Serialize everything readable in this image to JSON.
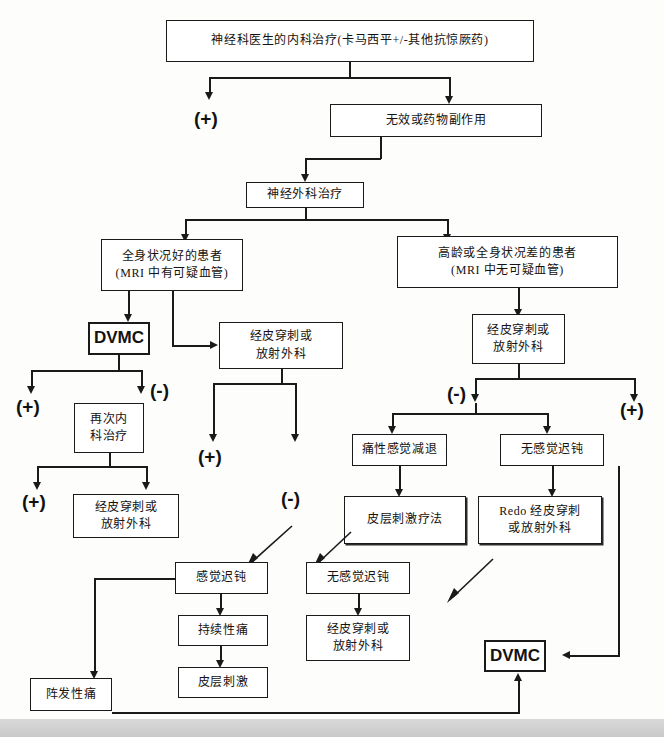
{
  "diagram": {
    "title_text": "神经科医生的内科治疗(卡马西平+/-其他抗惊厥药)",
    "nodes": {
      "medical_treatment": "神经科医生的内科治疗(卡马西平+/-其他抗惊厥药)",
      "ineffective_side_effects": "无效或药物副作用",
      "neurosurgical_treatment": "神经外科治疗",
      "good_condition_patient": "全身状况好的患者\n(MRI 中有可疑血管)",
      "elderly_poor_condition_patient": "高龄或全身状况差的患者\n(MRI 中无可疑血管)",
      "dvmc_top": "DVMC",
      "percutaneous_left": "经皮穿刺或\n放射外科",
      "percutaneous_right": "经皮穿刺或\n放射外科",
      "repeat_medical": "再次内\n科治疗",
      "percutaneous_after_repeat": "经皮穿刺或\n放射外科",
      "painful_anesthesia": "痛性感觉减退",
      "no_sensory_dullness_upper": "无感觉迟钝",
      "cortical_stimulation_therapy": "皮层刺激疗法",
      "redo_percutaneous": "Redo 经皮穿刺\n或放射外科",
      "sensory_dullness": "感觉迟钝",
      "no_sensory_dullness_lower": "无感觉迟钝",
      "persistent_pain": "持续性痛",
      "percutaneous_lower": "经皮穿刺或\n放射外科",
      "cortical_stimulation": "皮层刺激",
      "paroxysmal_pain": "阵发性痛",
      "dvmc_bottom": "DVMC"
    },
    "signs": {
      "plus_top_left": "(+)",
      "minus_after_dvmc": "(-)",
      "plus_after_dvmc": "(+)",
      "plus_after_repeat": "(+)",
      "plus_mid": "(+)",
      "minus_mid": "(-)",
      "minus_right": "(-)",
      "plus_right": "(+)"
    },
    "colors": {
      "line": "#1a1a1a",
      "box_fill": "#ffffff",
      "text": "#15120f",
      "page_background": "#fdfdfc"
    }
  }
}
